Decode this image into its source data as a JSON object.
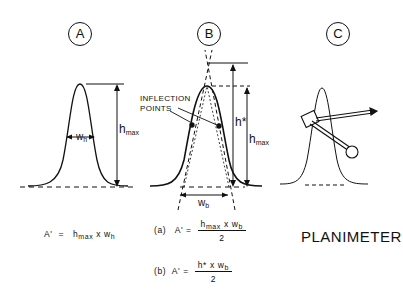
{
  "panels": [
    {
      "id": "A",
      "label": "A",
      "annotations": {
        "width": "w",
        "width_sub": "h",
        "height": "h",
        "height_sub": "max"
      },
      "formula": {
        "lhs": "A'",
        "eq": "=",
        "rhs_parts": [
          "h",
          "max",
          "x",
          "w",
          "h"
        ]
      }
    },
    {
      "id": "B",
      "label": "B",
      "annotations": {
        "inflection": [
          "INFLECTION",
          "POINTS"
        ],
        "hstar": "h*",
        "height": "h",
        "height_sub": "max",
        "width": "w",
        "width_sub": "b"
      },
      "formulas": [
        {
          "tag": "(a)",
          "lhs": "A'",
          "eq": "=",
          "num": [
            "h",
            "max",
            "x",
            "w",
            "b"
          ],
          "den": "2"
        },
        {
          "tag": "(b)",
          "lhs": "A'",
          "eq": "=",
          "num": [
            "h*",
            "x",
            "w",
            "b"
          ],
          "den": "2"
        }
      ]
    },
    {
      "id": "C",
      "label": "C",
      "caption": "PLANIMETER"
    }
  ],
  "colors": {
    "ink": "#111111",
    "background": "#ffffff"
  }
}
